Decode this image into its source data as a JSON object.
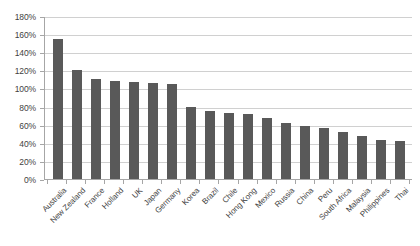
{
  "chart_data": {
    "type": "bar",
    "title": "",
    "subtitle": "",
    "xlabel": "",
    "ylabel": "",
    "ylim": [
      0,
      180
    ],
    "ytick_step": 20,
    "ytick_labels": [
      "0%",
      "20%",
      "40%",
      "60%",
      "80%",
      "100%",
      "120%",
      "140%",
      "160%",
      "180%"
    ],
    "grid": true,
    "legend": false,
    "legend_position": "none",
    "bar_color": "#595959",
    "gridline_color": "#d0d0d0",
    "axis_color": "#a6a6a6",
    "categories": [
      "Australia",
      "New Zealand",
      "France",
      "Holland",
      "UK",
      "Japan",
      "Germany",
      "Korea",
      "Brazil",
      "Chile",
      "Hong Kong",
      "Mexico",
      "Russia",
      "China",
      "Peru",
      "South Africa",
      "Malaysia",
      "Philippines",
      "Thai"
    ],
    "values": [
      155,
      120,
      110,
      108,
      107,
      106,
      105,
      80,
      75,
      73,
      72,
      67,
      62,
      58,
      56,
      52,
      48,
      43,
      42
    ]
  }
}
